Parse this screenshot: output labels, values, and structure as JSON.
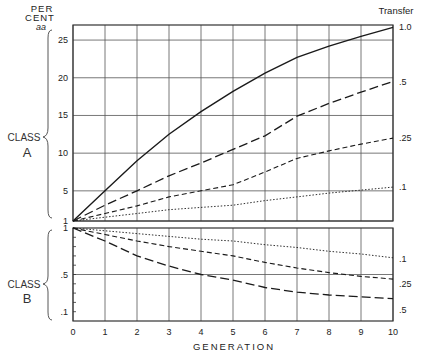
{
  "chart_data": [
    {
      "type": "line",
      "panel": "Class A",
      "title": "",
      "ylabel_top": [
        "PER",
        "CENT",
        "aa"
      ],
      "group_label": [
        "CLASS",
        "A"
      ],
      "legend_title": "Transfer",
      "xlabel": "GENERATION",
      "x": [
        0,
        1,
        2,
        3,
        4,
        5,
        6,
        7,
        8,
        9,
        10
      ],
      "xticks": [
        "0",
        "1",
        "2",
        "3",
        "4",
        "5",
        "6",
        "7",
        "8",
        "9",
        "10"
      ],
      "yticks": [
        {
          "value": 1,
          "label": "1"
        },
        {
          "value": 5,
          "label": "5"
        },
        {
          "value": 10,
          "label": "10"
        },
        {
          "value": 15,
          "label": "15"
        },
        {
          "value": 20,
          "label": "20"
        },
        {
          "value": 25,
          "label": "25"
        }
      ],
      "ylim": [
        1,
        27
      ],
      "xlim": [
        0,
        10
      ],
      "grid": true,
      "legend_placement": "right-end-labels",
      "series": [
        {
          "name": "1.0",
          "style": "solid",
          "values": [
            1,
            5,
            9,
            12.5,
            15.5,
            18.2,
            20.6,
            22.7,
            24.2,
            25.5,
            26.7
          ]
        },
        {
          "name": ".5",
          "style": "long-dash",
          "values": [
            1,
            3.1,
            5,
            7,
            8.7,
            10.5,
            12.3,
            14.9,
            16.6,
            18.1,
            19.5
          ]
        },
        {
          "name": ".25",
          "style": "short-dash",
          "values": [
            1,
            2,
            3,
            4.2,
            5,
            5.8,
            7.5,
            9.3,
            10.3,
            11.2,
            12
          ]
        },
        {
          "name": ".1",
          "style": "dotted",
          "values": [
            1,
            1.5,
            2,
            2.5,
            2.8,
            3.1,
            3.7,
            4.2,
            4.7,
            5.1,
            5.5
          ]
        }
      ]
    },
    {
      "type": "line",
      "panel": "Class B",
      "group_label": [
        "CLASS",
        "B"
      ],
      "x": [
        0,
        1,
        2,
        3,
        4,
        5,
        6,
        7,
        8,
        9,
        10
      ],
      "yticks": [
        {
          "value": 1,
          "label": "1"
        },
        {
          "value": 0.5,
          "label": ".5"
        },
        {
          "value": 0.1,
          "label": ".1"
        }
      ],
      "ylim": [
        0,
        1
      ],
      "xlim": [
        0,
        10
      ],
      "grid": true,
      "minor_ticks_step": 0.1,
      "series": [
        {
          "name": ".1",
          "style": "dotted",
          "values": [
            1,
            0.97,
            0.94,
            0.91,
            0.88,
            0.86,
            0.82,
            0.79,
            0.75,
            0.72,
            0.68
          ]
        },
        {
          "name": ".25",
          "style": "short-dash",
          "values": [
            1,
            0.93,
            0.86,
            0.8,
            0.75,
            0.7,
            0.63,
            0.57,
            0.52,
            0.48,
            0.45
          ]
        },
        {
          "name": ".5",
          "style": "long-dash",
          "values": [
            1,
            0.86,
            0.7,
            0.59,
            0.5,
            0.44,
            0.36,
            0.31,
            0.28,
            0.26,
            0.24
          ]
        }
      ]
    }
  ]
}
